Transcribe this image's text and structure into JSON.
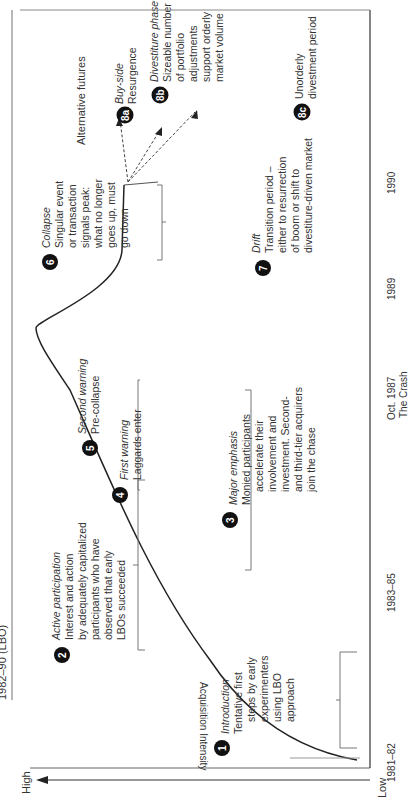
{
  "title": "1982–90 (LBO)",
  "axes": {
    "y_label": "Acquisition Intensity",
    "y_high": "High",
    "y_low": "Low",
    "x_ticks": [
      {
        "label": "1981–82",
        "sub": ""
      },
      {
        "label": "1983–85",
        "sub": ""
      },
      {
        "label": "Oct. 1987",
        "sub": "The Crash"
      },
      {
        "label": "1989",
        "sub": ""
      },
      {
        "label": "1990",
        "sub": ""
      }
    ]
  },
  "alternative_futures_label": "Alternative futures",
  "stages": [
    {
      "num": "1",
      "title": "Introduction",
      "lines": [
        "Tentative first",
        "steps by early",
        "experimenters",
        "using LBO",
        "approach"
      ]
    },
    {
      "num": "2",
      "title": "Active participation",
      "lines": [
        "Interest and action",
        "by adequately capitalized",
        "participants who have",
        "observed that early",
        "LBOs succeeded"
      ]
    },
    {
      "num": "3",
      "title": "Major emphasis",
      "lines": [
        "Monied participants",
        "accelerate their",
        "involvement and",
        "investment. Second-",
        "and third-tier acquirers",
        "join the chase"
      ]
    },
    {
      "num": "4",
      "title": "First warning",
      "lines": [
        "Laggards enter"
      ]
    },
    {
      "num": "5",
      "title": "Second warning",
      "lines": [
        "Pre-collapse"
      ]
    },
    {
      "num": "6",
      "title": "Collapse",
      "lines": [
        "Singular event",
        "or transaction",
        "signals peak:",
        "what no longer",
        "goes up, must",
        "go down"
      ]
    },
    {
      "num": "7",
      "title": "Drift",
      "lines": [
        "Transition period –",
        "either to resurrection",
        "of boom or shift to",
        "divestiture-driven market"
      ]
    },
    {
      "num": "8a",
      "title": "Buy-side",
      "lines": [
        "Resurgence"
      ]
    },
    {
      "num": "8b",
      "title": "Divestiture phase",
      "lines": [
        "Sizeable number",
        "of portfolio",
        "adjustments",
        "support orderly",
        "market volume"
      ]
    },
    {
      "num": "8c",
      "title": "",
      "lines": [
        "Unorderly",
        "divestment period"
      ]
    }
  ]
}
